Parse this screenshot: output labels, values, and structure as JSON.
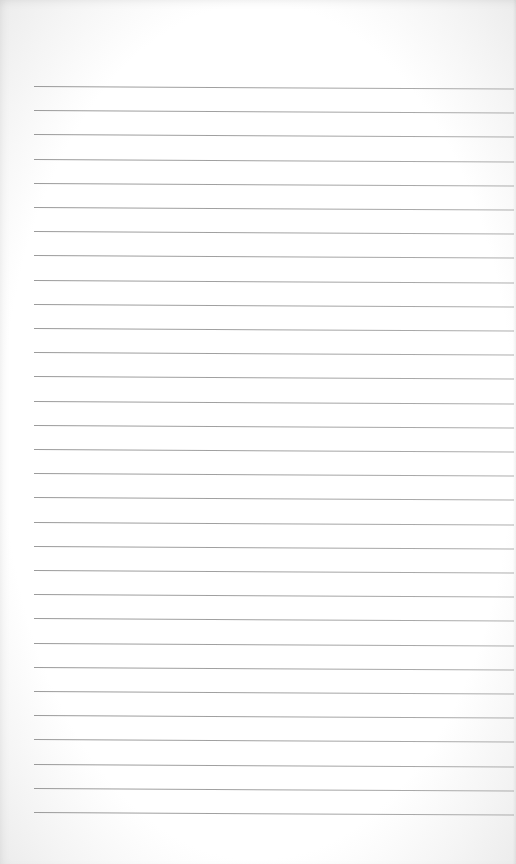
{
  "document": {
    "type": "lined-paper",
    "background_color": "#ffffff",
    "rule_color": "#999999",
    "rule_count": 31,
    "rule_start_y": 86,
    "rule_spacing": 24.2,
    "rule_left_x": 34,
    "rule_right_x": 514,
    "text_lines": []
  }
}
